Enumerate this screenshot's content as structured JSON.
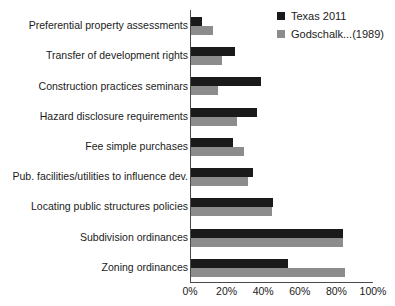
{
  "legend": {
    "position": "top-right",
    "entries": [
      {
        "label": "Texas 2011",
        "color": "#1a1a1a",
        "swatch_name": "legend-swatch-texas-2011"
      },
      {
        "label": "Godschalk...(1989)",
        "color": "#8c8c8c",
        "swatch_name": "legend-swatch-godschalk-1989"
      }
    ]
  },
  "axis": {
    "x_tick_labels": [
      "0%",
      "20%",
      "40%",
      "60%",
      "80%",
      "100%"
    ],
    "x_min": 0,
    "x_max": 100,
    "x_step": 20
  },
  "chart_data": {
    "type": "bar",
    "orientation": "horizontal",
    "title": "",
    "subtitle": "",
    "xlabel": "",
    "ylabel": "",
    "xlim": [
      0,
      100
    ],
    "xticks": [
      0,
      20,
      40,
      60,
      80,
      100
    ],
    "xtick_labels": [
      "0%",
      "20%",
      "40%",
      "60%",
      "80%",
      "100%"
    ],
    "grid": false,
    "legend_position": "top-right",
    "categories": [
      "Preferential property assessments",
      "Transfer of development rights",
      "Construction practices seminars",
      "Hazard disclosure requirements",
      "Fee simple purchases",
      "Pub. facilities/utilities to influence dev.",
      "Locating public structures policies",
      "Subdivision ordinances",
      "Zoning ordinances"
    ],
    "series": [
      {
        "name": "Texas 2011",
        "color": "#1a1a1a",
        "values": [
          6,
          24,
          38,
          36,
          23,
          34,
          45,
          83,
          53
        ]
      },
      {
        "name": "Godschalk...(1989)",
        "color": "#8c8c8c",
        "values": [
          12,
          17,
          15,
          25,
          29,
          31,
          44,
          83,
          84
        ]
      }
    ]
  }
}
